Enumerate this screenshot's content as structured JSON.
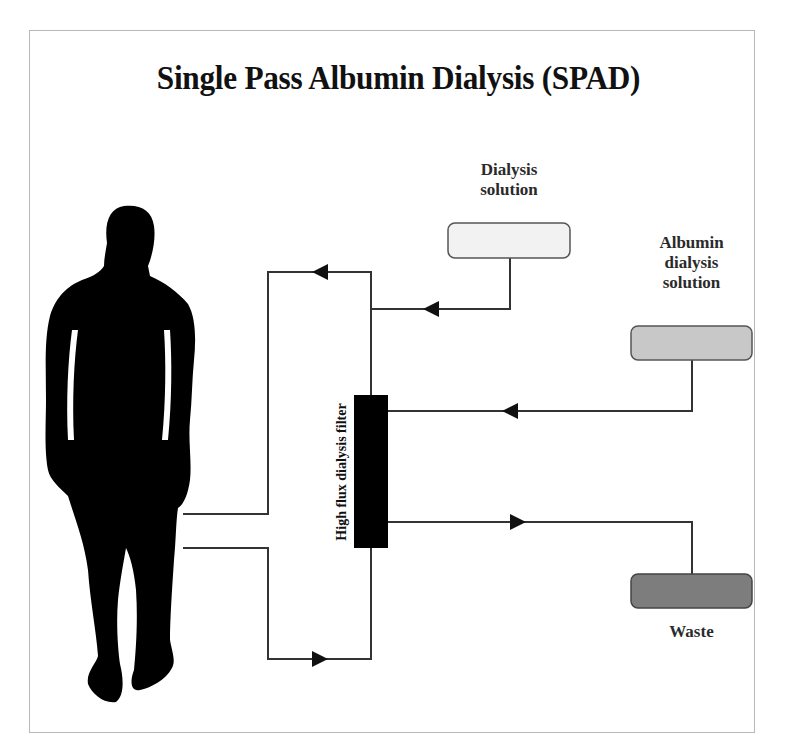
{
  "diagram": {
    "title": "Single Pass Albumin Dialysis (SPAD)",
    "nodes": [
      {
        "id": "patient",
        "label": "",
        "shape": "human-silhouette",
        "color": "#000000"
      },
      {
        "id": "filter",
        "label": "High flux dialysis filter",
        "shape": "rect",
        "color": "#000000"
      },
      {
        "id": "dialysis_solution",
        "label": "Dialysis solution",
        "label_lines": [
          "Dialysis",
          "solution"
        ],
        "shape": "rounded-rect",
        "color": "#f2f2f2"
      },
      {
        "id": "albumin_solution",
        "label": "Albumin dialysis solution",
        "label_lines": [
          "Albumin",
          "dialysis",
          "solution"
        ],
        "shape": "rounded-rect",
        "color": "#c8c8c8"
      },
      {
        "id": "waste",
        "label": "Waste",
        "label_lines": [
          "Waste"
        ],
        "shape": "rounded-rect",
        "color": "#7d7d7d"
      }
    ],
    "edges": [
      {
        "from": "patient",
        "to": "filter",
        "path": "bottom loop",
        "arrow": "right"
      },
      {
        "from": "filter",
        "to": "patient",
        "path": "top loop",
        "arrow": "left"
      },
      {
        "from": "dialysis_solution",
        "to": "filter",
        "path": "joins top line",
        "arrow": "left"
      },
      {
        "from": "albumin_solution",
        "to": "filter",
        "arrow": "left"
      },
      {
        "from": "filter",
        "to": "waste",
        "arrow": "right"
      }
    ],
    "colors": {
      "line": "#333333",
      "frame_border": "#b8b8b8",
      "background": "#ffffff",
      "text": "#2a2a2a"
    }
  }
}
